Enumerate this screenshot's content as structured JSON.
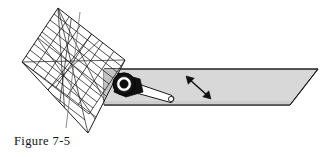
{
  "figure": {
    "caption": "Figure 7-5",
    "background_color": "#ffffff",
    "line_color": "#1a1a1a",
    "ramp_fill": "#d8d8d8",
    "ramp_edge_fill": "#bdbdbd",
    "grid_shadow_fill": "#c9c9c9",
    "hub_outer_color": "#111111",
    "hub_ring_color": "#ffffff",
    "hub_core_color": "#111111",
    "link_fill": "#ffffff",
    "arrow_color": "#111111"
  },
  "parts": {
    "grid_panel": {
      "name": "wire grid panel",
      "columns": 6,
      "rows": 9,
      "corners": [
        [
          58,
          8
        ],
        [
          125,
          60
        ],
        [
          88,
          133
        ],
        [
          22,
          62
        ]
      ]
    },
    "ramp": {
      "name": "ramp platform",
      "outline": [
        [
          104,
          69
        ],
        [
          318,
          69
        ],
        [
          290,
          105
        ],
        [
          104,
          105
        ]
      ]
    },
    "hub": {
      "name": "pivot hub",
      "center": [
        124,
        84
      ],
      "outer_radius": 11,
      "ring_radius": 7,
      "core_radius": 4
    },
    "link_arm": {
      "name": "link arm",
      "pivot": [
        124,
        84
      ],
      "pin": [
        172,
        99
      ],
      "pin_radius": 2.6
    },
    "motion_arrow": {
      "name": "double headed motion arrow",
      "start": [
        186,
        76
      ],
      "end": [
        211,
        99
      ],
      "double_headed": true
    }
  }
}
